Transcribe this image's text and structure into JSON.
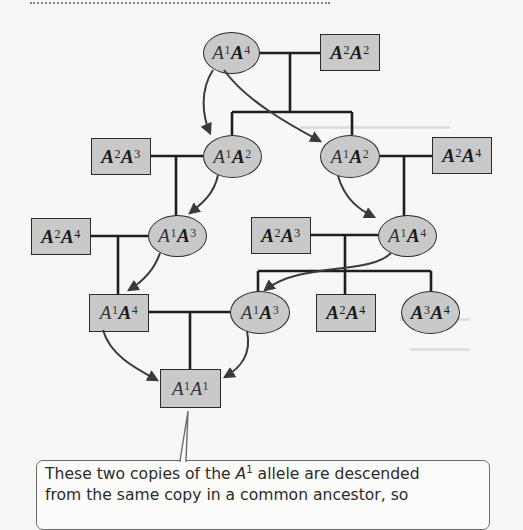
{
  "figure": {
    "type": "pedigree",
    "nodes": [
      {
        "id": "g1-female",
        "sex": "female",
        "allele1": "1",
        "allele2": "4",
        "label": "A1A4"
      },
      {
        "id": "g1-male",
        "sex": "male",
        "allele1": "2",
        "allele2": "2",
        "label": "A2A2"
      },
      {
        "id": "g2-left-male",
        "sex": "male",
        "allele1": "2",
        "allele2": "3",
        "label": "A2A3"
      },
      {
        "id": "g2-left-female",
        "sex": "female",
        "allele1": "1",
        "allele2": "2",
        "label": "A1A2"
      },
      {
        "id": "g2-right-female",
        "sex": "female",
        "allele1": "1",
        "allele2": "2",
        "label": "A1A2"
      },
      {
        "id": "g2-right-male",
        "sex": "male",
        "allele1": "2",
        "allele2": "4",
        "label": "A2A4"
      },
      {
        "id": "g3-left-male",
        "sex": "male",
        "allele1": "2",
        "allele2": "4",
        "label": "A2A4"
      },
      {
        "id": "g3-left-female",
        "sex": "female",
        "allele1": "1",
        "allele2": "3",
        "label": "A1A3"
      },
      {
        "id": "g3-right-male",
        "sex": "male",
        "allele1": "2",
        "allele2": "3",
        "label": "A2A3"
      },
      {
        "id": "g3-right-female",
        "sex": "female",
        "allele1": "1",
        "allele2": "4",
        "label": "A1A4"
      },
      {
        "id": "g4-male",
        "sex": "male",
        "allele1": "1",
        "allele2": "4",
        "label": "A1A4"
      },
      {
        "id": "g4-female",
        "sex": "female",
        "allele1": "1",
        "allele2": "3",
        "label": "A1A3"
      },
      {
        "id": "g4-sib-male",
        "sex": "male",
        "allele1": "2",
        "allele2": "4",
        "label": "A2A4"
      },
      {
        "id": "g4-sib-female",
        "sex": "female",
        "allele1": "3",
        "allele2": "4",
        "label": "A3A4"
      },
      {
        "id": "g5-inbred",
        "sex": "male",
        "allele1": "1",
        "allele2": "1",
        "label": "A1A1"
      }
    ],
    "allele_symbol": "A",
    "callout": {
      "line1_pre": "These two copies of the ",
      "line1_allele": "A",
      "line1_sup": "1",
      "line1_post": " allele are descended",
      "line2": "from the same copy in a common ancestor, so"
    },
    "colors": {
      "node_fill": "#c9c9c9",
      "node_border": "#2a2a2a",
      "arrow": "#3a3a3a",
      "callout_border": "#6b6b6b",
      "background": "#f7f7f5"
    }
  }
}
